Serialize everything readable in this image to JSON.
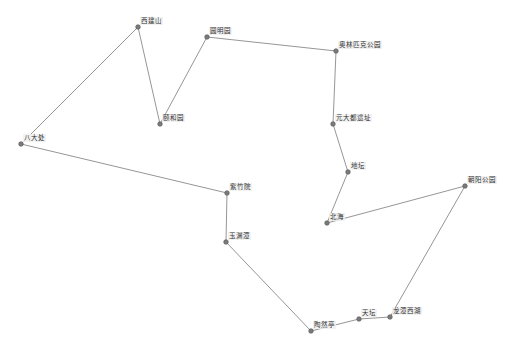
{
  "diagram": {
    "type": "route-graph",
    "colors": {
      "edge": "#8a8a8a",
      "node": "#7a7a7a",
      "background": "#ffffff"
    },
    "nodes": [
      {
        "id": "xijianshan",
        "label": "西建山",
        "x": 138,
        "y": 27
      },
      {
        "id": "yiheyuan",
        "label": "颐和园",
        "x": 160,
        "y": 124
      },
      {
        "id": "yuanmingyuan",
        "label": "圆明园",
        "x": 207,
        "y": 37
      },
      {
        "id": "olympic",
        "label": "奥林匹克公园",
        "x": 336,
        "y": 51
      },
      {
        "id": "yuandadu",
        "label": "元大都遗址",
        "x": 333,
        "y": 124
      },
      {
        "id": "ditan",
        "label": "地坛",
        "x": 348,
        "y": 172
      },
      {
        "id": "beihai",
        "label": "北海",
        "x": 327,
        "y": 223
      },
      {
        "id": "chaoyang",
        "label": "朝阳公园",
        "x": 465,
        "y": 186
      },
      {
        "id": "longtan",
        "label": "龙潭西湖",
        "x": 390,
        "y": 317
      },
      {
        "id": "tiantan",
        "label": "天坛",
        "x": 359,
        "y": 319
      },
      {
        "id": "taoranting",
        "label": "陶然亭",
        "x": 311,
        "y": 331
      },
      {
        "id": "yuyuantan",
        "label": "玉渊潭",
        "x": 226,
        "y": 242
      },
      {
        "id": "zizhuyuan",
        "label": "紫竹院",
        "x": 227,
        "y": 193
      },
      {
        "id": "badachu",
        "label": "八大处",
        "x": 21,
        "y": 144
      }
    ],
    "path_order": [
      "badachu",
      "xijianshan",
      "yiheyuan",
      "yuanmingyuan",
      "olympic",
      "yuandadu",
      "ditan",
      "beihai",
      "chaoyang",
      "longtan",
      "tiantan",
      "taoranting",
      "yuyuantan",
      "zizhuyuan",
      "badachu"
    ]
  }
}
